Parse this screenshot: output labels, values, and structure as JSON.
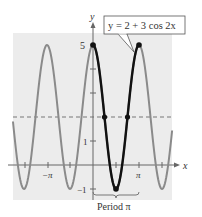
{
  "chart_data": {
    "type": "line",
    "title": "",
    "equation_label": "y = 2 + 3 cos 2x",
    "function": "2 + 3*cos(2*x)",
    "xlabel": "x",
    "ylabel": "y",
    "x_range": [
      -1.74,
      1.72
    ],
    "x_range_units": "pi",
    "ylim": [
      -1.4,
      5.5
    ],
    "x_ticks": [
      {
        "value_pi": -1.5,
        "label": ""
      },
      {
        "value_pi": -1,
        "label": "−π"
      },
      {
        "value_pi": -0.5,
        "label": ""
      },
      {
        "value_pi": 0.5,
        "label": ""
      },
      {
        "value_pi": 1,
        "label": "π"
      },
      {
        "value_pi": 1.5,
        "label": ""
      }
    ],
    "y_ticks": [
      {
        "value": -1,
        "label": "−1"
      },
      {
        "value": 1,
        "label": "1"
      },
      {
        "value": 3,
        "label": ""
      },
      {
        "value": 4,
        "label": ""
      },
      {
        "value": 5,
        "label": "5"
      }
    ],
    "midline": {
      "y": 2,
      "style": "dashed"
    },
    "series": [
      {
        "name": "full curve",
        "color": "#8a8a8a",
        "domain_pi": [
          -1.74,
          1.72
        ]
      },
      {
        "name": "one period",
        "color": "#111111",
        "domain_pi": [
          0,
          1
        ]
      }
    ],
    "key_points": [
      {
        "x_pi": 0,
        "y": 5
      },
      {
        "x_pi": 0.25,
        "y": 2
      },
      {
        "x_pi": 0.5,
        "y": -1
      },
      {
        "x_pi": 0.75,
        "y": 2
      },
      {
        "x_pi": 1,
        "y": 5
      }
    ],
    "annotation": {
      "text": "Period π",
      "from_pi": 0,
      "to_pi": 1
    },
    "grid": false,
    "background": "#ececec"
  },
  "labels": {
    "equation": "y = 2 + 3 cos 2x",
    "x_axis": "x",
    "y_axis": "y",
    "tick_neg_pi": "−π",
    "tick_pi": "π",
    "tick_y5": "5",
    "tick_y1": "1",
    "tick_yneg1": "−1",
    "period": "Period π"
  }
}
